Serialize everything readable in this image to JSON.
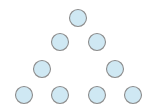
{
  "diagram": {
    "type": "triangular-node-arrangement",
    "node_fill": "#cfe8f3",
    "node_stroke": "#8c8c8c",
    "node_radius": 8.5,
    "rows": [
      {
        "row": 1,
        "nodes": [
          {
            "cx": 78,
            "cy": 18
          }
        ]
      },
      {
        "row": 2,
        "nodes": [
          {
            "cx": 60,
            "cy": 42
          },
          {
            "cx": 97,
            "cy": 42
          }
        ]
      },
      {
        "row": 3,
        "nodes": [
          {
            "cx": 42,
            "cy": 69
          },
          {
            "cx": 115,
            "cy": 69
          }
        ]
      },
      {
        "row": 4,
        "nodes": [
          {
            "cx": 24,
            "cy": 95
          },
          {
            "cx": 60,
            "cy": 95
          },
          {
            "cx": 97,
            "cy": 95
          },
          {
            "cx": 133,
            "cy": 95
          }
        ]
      }
    ],
    "node_count": 9
  }
}
